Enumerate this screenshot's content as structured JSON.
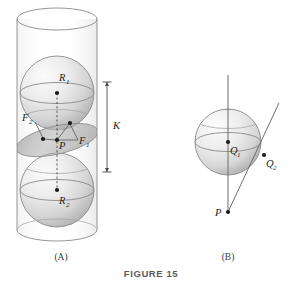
{
  "figure": {
    "caption": "FIGURE 15",
    "panels": [
      {
        "id": "A",
        "label": "(A)",
        "description": "Two spheres inscribed in a cylinder (Dandelin spheres) with a tangent plane section",
        "labels": {
          "top_sphere_center": "R",
          "top_sphere_center_sub": "1",
          "bottom_sphere_center": "R",
          "bottom_sphere_center_sub": "2",
          "focus_left": "F",
          "focus_left_sub": "2",
          "focus_right": "F",
          "focus_right_sub": "1",
          "point": "P",
          "distance": "K"
        }
      },
      {
        "id": "B",
        "label": "(B)",
        "description": "Sphere with a vertical line through Q1 and a slanted tangent line from P through Q2",
        "labels": {
          "sphere_center": "Q",
          "sphere_center_sub": "1",
          "tangent_point": "Q",
          "tangent_point_sub": "2",
          "external_point": "P"
        }
      }
    ]
  },
  "colors": {
    "ink": "#231f20",
    "outline": "#8a8a8a",
    "sphere_light": "#f2f2f2",
    "sphere_shade": "#b9b9b9",
    "plane_fill": "#b5b5b5",
    "caption": "#5a5a5a"
  }
}
